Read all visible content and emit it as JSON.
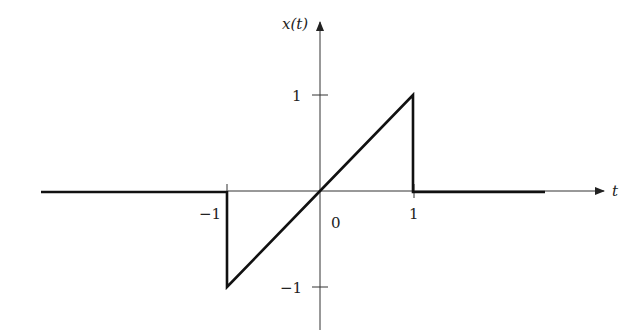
{
  "diagram": {
    "type": "signal-plot",
    "axes": {
      "horizontal_label": "t",
      "vertical_label": "x(t)",
      "origin_label": "0"
    },
    "ticks": {
      "t_neg": "−1",
      "t_pos": "1",
      "y_pos": "1",
      "y_neg": "−1"
    },
    "signal": {
      "description": "x(t) = t for -1 < t < 1, 0 otherwise",
      "points": [
        [
          -3.5,
          0
        ],
        [
          -1,
          0
        ],
        [
          -1,
          -1
        ],
        [
          1,
          1
        ],
        [
          1,
          0
        ],
        [
          3.2,
          0
        ]
      ]
    },
    "colors": {
      "signal": "#111111",
      "axis": "#333333",
      "background": "#ffffff"
    }
  }
}
